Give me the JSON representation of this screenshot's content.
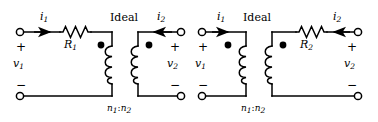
{
  "figure": {
    "type": "circuit-diagram",
    "background_color": "#ffffff",
    "line_color": "#000000"
  },
  "circuits": [
    {
      "id": "left",
      "transformer_label": "Ideal",
      "turns_ratio": {
        "n1": "n",
        "n1_sub": "1",
        "separator": ":",
        "n2": "n",
        "n2_sub": "2"
      },
      "resistor": {
        "name": "R",
        "subscript": "1",
        "side": "primary"
      },
      "primary": {
        "current": "i",
        "current_sub": "1",
        "voltage": "v",
        "voltage_sub": "1",
        "plus": "+",
        "minus": "−"
      },
      "secondary": {
        "current": "i",
        "current_sub": "2",
        "voltage": "v",
        "voltage_sub": "2",
        "plus": "+",
        "minus": "−"
      },
      "dots": [
        "primary-top",
        "secondary-top"
      ]
    },
    {
      "id": "right",
      "transformer_label": "Ideal",
      "turns_ratio": {
        "n1": "n",
        "n1_sub": "1",
        "separator": ":",
        "n2": "n",
        "n2_sub": "2"
      },
      "resistor": {
        "name": "R",
        "subscript": "2",
        "side": "secondary"
      },
      "primary": {
        "current": "i",
        "current_sub": "1",
        "voltage": "v",
        "voltage_sub": "1",
        "plus": "+",
        "minus": "−"
      },
      "secondary": {
        "current": "i",
        "current_sub": "2",
        "voltage": "v",
        "voltage_sub": "2",
        "plus": "+",
        "minus": "−"
      },
      "dots": [
        "primary-top",
        "secondary-top"
      ]
    }
  ]
}
